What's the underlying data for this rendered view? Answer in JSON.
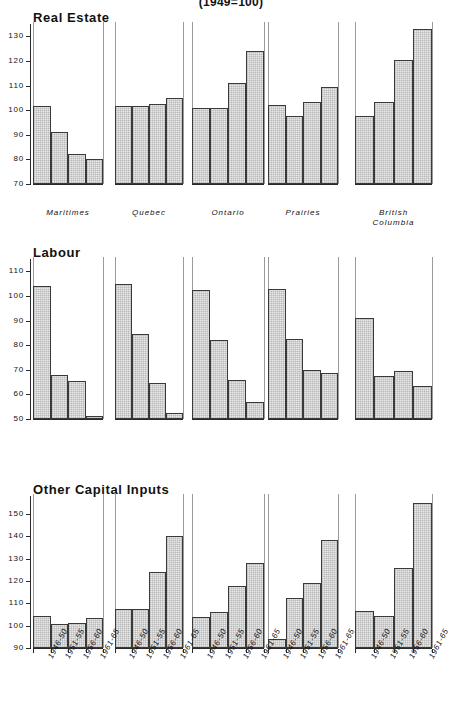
{
  "chart_title": "(1949=100)",
  "regions": [
    "Maritimes",
    "Quebec",
    "Ontario",
    "Prairies",
    "British\nColumbia"
  ],
  "periods": [
    "1946-50",
    "1951-55",
    "1956-60",
    "1961-65"
  ],
  "panels": [
    {
      "title": "Real  Estate",
      "ylim": [
        70,
        135
      ],
      "yticks": [
        70,
        80,
        90,
        100,
        110,
        120,
        130
      ],
      "series": [
        {
          "region": "Maritimes",
          "values": [
            101.5,
            91.0,
            82.0,
            80.0
          ]
        },
        {
          "region": "Quebec",
          "values": [
            101.5,
            101.8,
            102.5,
            105.0
          ]
        },
        {
          "region": "Ontario",
          "values": [
            100.8,
            100.8,
            111.0,
            124.0
          ]
        },
        {
          "region": "Prairies",
          "values": [
            102.2,
            97.5,
            103.5,
            109.5
          ]
        },
        {
          "region": "British Columbia",
          "values": [
            97.5,
            103.5,
            120.5,
            133.0
          ]
        }
      ]
    },
    {
      "title": "Labour",
      "ylim": [
        50,
        115
      ],
      "yticks": [
        50,
        60,
        70,
        80,
        90,
        100,
        110
      ],
      "series": [
        {
          "region": "Maritimes",
          "values": [
            104.0,
            67.8,
            65.5,
            51.2
          ]
        },
        {
          "region": "Quebec",
          "values": [
            105.0,
            84.5,
            64.8,
            52.3
          ]
        },
        {
          "region": "Ontario",
          "values": [
            102.5,
            82.2,
            66.0,
            57.0
          ]
        },
        {
          "region": "Prairies",
          "values": [
            102.8,
            82.3,
            69.8,
            68.5
          ]
        },
        {
          "region": "British Columbia",
          "values": [
            91.0,
            67.5,
            69.5,
            63.5
          ]
        }
      ]
    },
    {
      "title": "Other  Capital  Inputs",
      "ylim": [
        90,
        158
      ],
      "yticks": [
        90,
        100,
        110,
        120,
        130,
        140,
        150
      ],
      "series": [
        {
          "region": "Maritimes",
          "values": [
            104.5,
            100.8,
            101.3,
            103.5
          ]
        },
        {
          "region": "Quebec",
          "values": [
            107.5,
            107.5,
            123.8,
            140.2
          ]
        },
        {
          "region": "Ontario",
          "values": [
            104.0,
            106.0,
            117.8,
            128.2
          ]
        },
        {
          "region": "Prairies",
          "values": [
            94.0,
            112.2,
            119.2,
            138.5
          ]
        },
        {
          "region": "British Columbia",
          "values": [
            106.5,
            104.3,
            125.8,
            155.0
          ]
        }
      ]
    }
  ],
  "chart_data": {
    "type": "bar",
    "title": "(1949=100)",
    "xlabel": "",
    "ylabel": "",
    "grid": false,
    "legend": "none",
    "note": "Three stacked small-multiple bar panels; each panel has five regional groups of four five-year-period bars.",
    "categories": [
      "1946-50",
      "1951-55",
      "1956-60",
      "1961-65"
    ],
    "groups": [
      "Maritimes",
      "Quebec",
      "Ontario",
      "Prairies",
      "British Columbia"
    ],
    "panels": [
      {
        "title": "Real Estate",
        "ylim": [
          70,
          135
        ],
        "yticks": [
          70,
          80,
          90,
          100,
          110,
          120,
          130
        ],
        "series": [
          {
            "name": "Maritimes",
            "values": [
              101.5,
              91.0,
              82.0,
              80.0
            ]
          },
          {
            "name": "Quebec",
            "values": [
              101.5,
              101.8,
              102.5,
              105.0
            ]
          },
          {
            "name": "Ontario",
            "values": [
              100.8,
              100.8,
              111.0,
              124.0
            ]
          },
          {
            "name": "Prairies",
            "values": [
              102.2,
              97.5,
              103.5,
              109.5
            ]
          },
          {
            "name": "British Columbia",
            "values": [
              97.5,
              103.5,
              120.5,
              133.0
            ]
          }
        ]
      },
      {
        "title": "Labour",
        "ylim": [
          50,
          115
        ],
        "yticks": [
          50,
          60,
          70,
          80,
          90,
          100,
          110
        ],
        "series": [
          {
            "name": "Maritimes",
            "values": [
              104.0,
              67.8,
              65.5,
              51.2
            ]
          },
          {
            "name": "Quebec",
            "values": [
              105.0,
              84.5,
              64.8,
              52.3
            ]
          },
          {
            "name": "Ontario",
            "values": [
              102.5,
              82.2,
              66.0,
              57.0
            ]
          },
          {
            "name": "Prairies",
            "values": [
              102.8,
              82.3,
              69.8,
              68.5
            ]
          },
          {
            "name": "British Columbia",
            "values": [
              91.0,
              67.5,
              69.5,
              63.5
            ]
          }
        ]
      },
      {
        "title": "Other Capital Inputs",
        "ylim": [
          90,
          158
        ],
        "yticks": [
          90,
          100,
          110,
          120,
          130,
          140,
          150
        ],
        "series": [
          {
            "name": "Maritimes",
            "values": [
              104.5,
              100.8,
              101.3,
              103.5
            ]
          },
          {
            "name": "Quebec",
            "values": [
              107.5,
              107.5,
              123.8,
              140.2
            ]
          },
          {
            "name": "Ontario",
            "values": [
              104.0,
              106.0,
              117.8,
              128.2
            ]
          },
          {
            "name": "Prairies",
            "values": [
              94.0,
              112.2,
              119.2,
              138.5
            ]
          },
          {
            "name": "British Columbia",
            "values": [
              106.5,
              104.3,
              125.8,
              155.0
            ]
          }
        ]
      }
    ]
  }
}
